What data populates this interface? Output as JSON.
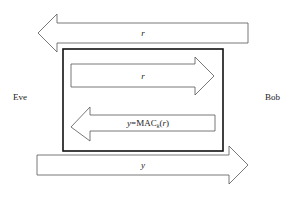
{
  "diagram": {
    "parties": {
      "left": "Eve",
      "right": "Bob"
    },
    "arrows": [
      {
        "id": "outer-top",
        "direction": "left",
        "label": "r"
      },
      {
        "id": "inner-top",
        "direction": "right",
        "label": "r"
      },
      {
        "id": "inner-bottom",
        "direction": "left",
        "label_prefix": "y",
        "label_eq": "=",
        "label_fn": "MAC",
        "label_sub": "k",
        "label_open": "(",
        "label_arg": "r",
        "label_close": ")"
      },
      {
        "id": "outer-bottom",
        "direction": "right",
        "label": "y"
      }
    ],
    "colors": {
      "arrow_stroke": "#555555",
      "box_stroke": "#111111",
      "text": "#222222"
    }
  }
}
